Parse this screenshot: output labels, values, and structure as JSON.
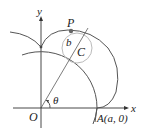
{
  "diagram": {
    "type": "epicycloid-construction",
    "labels": {
      "y_axis": "y",
      "x_axis": "x",
      "origin": "O",
      "point_p": "P",
      "radius_b": "b",
      "center_c": "C",
      "angle": "θ",
      "point_a": "A(a, 0)"
    },
    "elements": [
      "x-axis",
      "y-axis",
      "fixed circle of radius a centered at O",
      "rolling circle of radius b centered at C",
      "line from O through C to P",
      "epicycloid curve traced by P",
      "angle θ at O"
    ],
    "colors": {
      "curve": "#555555",
      "small_circle": "#bbbbbb",
      "axes": "#333333",
      "text": "#222222"
    }
  }
}
